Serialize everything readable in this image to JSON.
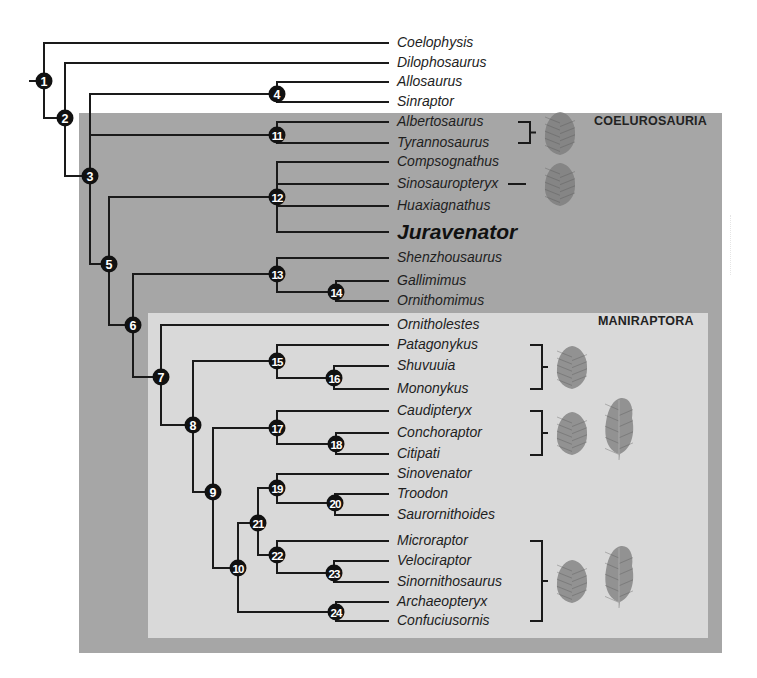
{
  "figure": {
    "type": "cladogram",
    "clades": [
      {
        "name": "coelurosauria",
        "label": "COELUROSAURIA",
        "label_x": 594,
        "label_y": 119
      },
      {
        "name": "maniraptora",
        "label": "MANIRAPTORA",
        "label_x": 598,
        "label_y": 319
      }
    ],
    "colors": {
      "coelurosauria_bg": "#a6a6a6",
      "maniraptora_bg": "#d9d9d9",
      "branch": "#1a1a1a",
      "node_fill": "#111111",
      "node_text": "#ffffff",
      "feather": "#7a7a7a"
    },
    "leaf_x": 388,
    "taxa": [
      {
        "name": "Coelophysis",
        "y": 43
      },
      {
        "name": "Dilophosaurus",
        "y": 63
      },
      {
        "name": "Allosaurus",
        "y": 82
      },
      {
        "name": "Sinraptor",
        "y": 102
      },
      {
        "name": "Albertosaurus",
        "y": 122
      },
      {
        "name": "Tyrannosaurus",
        "y": 143
      },
      {
        "name": "Compsognathus",
        "y": 162
      },
      {
        "name": "Sinosauropteryx",
        "y": 184
      },
      {
        "name": "Huaxiagnathus",
        "y": 206
      },
      {
        "name": "Juravenator",
        "y": 232,
        "focus": true
      },
      {
        "name": "Shenzhousaurus",
        "y": 258
      },
      {
        "name": "Gallimimus",
        "y": 281
      },
      {
        "name": "Ornithomimus",
        "y": 301
      },
      {
        "name": "Ornitholestes",
        "y": 325
      },
      {
        "name": "Patagonykus",
        "y": 345
      },
      {
        "name": "Shuvuuia",
        "y": 366
      },
      {
        "name": "Mononykus",
        "y": 389
      },
      {
        "name": "Caudipteryx",
        "y": 411
      },
      {
        "name": "Conchoraptor",
        "y": 433
      },
      {
        "name": "Citipati",
        "y": 454
      },
      {
        "name": "Sinovenator",
        "y": 474
      },
      {
        "name": "Troodon",
        "y": 494
      },
      {
        "name": "Saurornithoides",
        "y": 515
      },
      {
        "name": "Microraptor",
        "y": 541
      },
      {
        "name": "Velociraptor",
        "y": 561
      },
      {
        "name": "Sinornithosaurus",
        "y": 582
      },
      {
        "name": "Archaeopteryx",
        "y": 602
      },
      {
        "name": "Confuciusornis",
        "y": 621
      }
    ],
    "nodes": [
      {
        "id": "1",
        "x": 44,
        "y": 81,
        "children": [
          "T:Coelophysis",
          "N:2"
        ]
      },
      {
        "id": "2",
        "x": 65,
        "y": 118,
        "children": [
          "T:Dilophosaurus",
          "N:3"
        ]
      },
      {
        "id": "3",
        "x": 90,
        "y": 176,
        "children": [
          "N:4",
          "N:11",
          "N:5"
        ]
      },
      {
        "id": "4",
        "x": 277,
        "y": 94,
        "children": [
          "T:Allosaurus",
          "T:Sinraptor"
        ]
      },
      {
        "id": "11",
        "x": 277,
        "y": 135,
        "children": [
          "T:Albertosaurus",
          "T:Tyrannosaurus"
        ]
      },
      {
        "id": "5",
        "x": 109,
        "y": 264,
        "children": [
          "N:12",
          "N:6"
        ]
      },
      {
        "id": "12",
        "x": 277,
        "y": 197,
        "children": [
          "T:Compsognathus",
          "T:Sinosauropteryx",
          "T:Huaxiagnathus",
          "T:Juravenator"
        ]
      },
      {
        "id": "6",
        "x": 133,
        "y": 325,
        "children": [
          "N:13",
          "N:7"
        ]
      },
      {
        "id": "13",
        "x": 277,
        "y": 274,
        "children": [
          "T:Shenzhousaurus",
          "N:14"
        ]
      },
      {
        "id": "14",
        "x": 336,
        "y": 292,
        "children": [
          "T:Gallimimus",
          "T:Ornithomimus"
        ]
      },
      {
        "id": "7",
        "x": 161,
        "y": 377,
        "children": [
          "T:Ornitholestes",
          "N:8"
        ]
      },
      {
        "id": "8",
        "x": 193,
        "y": 425,
        "children": [
          "N:15",
          "N:9"
        ]
      },
      {
        "id": "15",
        "x": 277,
        "y": 361,
        "children": [
          "T:Patagonykus",
          "N:16"
        ]
      },
      {
        "id": "16",
        "x": 334,
        "y": 378,
        "children": [
          "T:Shuvuuia",
          "T:Mononykus"
        ]
      },
      {
        "id": "9",
        "x": 213,
        "y": 492,
        "children": [
          "N:17",
          "N:10"
        ]
      },
      {
        "id": "17",
        "x": 277,
        "y": 428,
        "children": [
          "T:Caudipteryx",
          "N:18"
        ]
      },
      {
        "id": "18",
        "x": 336,
        "y": 444,
        "children": [
          "T:Conchoraptor",
          "T:Citipati"
        ]
      },
      {
        "id": "10",
        "x": 238,
        "y": 568,
        "children": [
          "N:21",
          "N:24"
        ]
      },
      {
        "id": "21",
        "x": 258,
        "y": 523,
        "children": [
          "N:19",
          "N:22"
        ]
      },
      {
        "id": "19",
        "x": 277,
        "y": 488,
        "children": [
          "T:Sinovenator",
          "N:20"
        ]
      },
      {
        "id": "20",
        "x": 335,
        "y": 503,
        "children": [
          "T:Troodon",
          "T:Saurornithoides"
        ]
      },
      {
        "id": "22",
        "x": 277,
        "y": 555,
        "children": [
          "T:Microraptor",
          "N:23"
        ]
      },
      {
        "id": "23",
        "x": 334,
        "y": 573,
        "children": [
          "T:Velociraptor",
          "T:Sinornithosaurus"
        ]
      },
      {
        "id": "24",
        "x": 336,
        "y": 612,
        "children": [
          "T:Archaeopteryx",
          "T:Confuciusornis"
        ]
      }
    ],
    "feather_groups": [
      {
        "name": "tyrannosauroid-feathers",
        "bracket_x": 530,
        "top": 122,
        "bottom": 143,
        "feather_types": [
          "filament"
        ]
      },
      {
        "name": "compsognathid-feathers",
        "line_only": true,
        "bracket_x": 530,
        "top": 184,
        "bottom": 184,
        "feather_types": [
          "filament"
        ]
      },
      {
        "name": "alvarezsaurid-feathers",
        "bracket_x": 542,
        "top": 345,
        "bottom": 389,
        "feather_types": [
          "filament"
        ]
      },
      {
        "name": "oviraptorosaur-feathers",
        "bracket_x": 542,
        "top": 411,
        "bottom": 455,
        "feather_types": [
          "filament",
          "vaned"
        ]
      },
      {
        "name": "paravian-feathers",
        "bracket_x": 542,
        "top": 541,
        "bottom": 621,
        "feather_types": [
          "filament",
          "vaned"
        ]
      }
    ]
  }
}
